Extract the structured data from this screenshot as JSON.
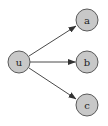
{
  "diagram": {
    "type": "directed-graph",
    "colors": {
      "node_fill": "#c8c8c8",
      "node_stroke": "#5a5a5a",
      "edge": "#4a4a4a",
      "label": "#222222",
      "background": "#ffffff"
    },
    "nodes": [
      {
        "id": "u",
        "label": "u",
        "cx": 19,
        "cy": 62,
        "r": 11
      },
      {
        "id": "a",
        "label": "a",
        "cx": 87,
        "cy": 20,
        "r": 11
      },
      {
        "id": "b",
        "label": "b",
        "cx": 87,
        "cy": 62,
        "r": 11
      },
      {
        "id": "c",
        "label": "c",
        "cx": 87,
        "cy": 105,
        "r": 11
      }
    ],
    "edges": [
      {
        "from": "u",
        "to": "a"
      },
      {
        "from": "u",
        "to": "b"
      },
      {
        "from": "u",
        "to": "c"
      }
    ]
  }
}
